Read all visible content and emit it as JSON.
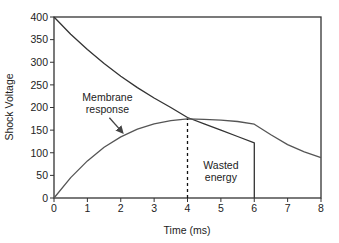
{
  "chart_data": {
    "type": "line",
    "title": "",
    "xlabel": "Time (ms)",
    "ylabel": "Shock Voltage",
    "xlim": [
      0,
      8
    ],
    "ylim": [
      0,
      400
    ],
    "x_ticks": [
      0,
      1,
      2,
      3,
      4,
      5,
      6,
      7,
      8
    ],
    "y_ticks": [
      0,
      50,
      100,
      150,
      200,
      250,
      300,
      350,
      400
    ],
    "grid": false,
    "legend": null,
    "series": [
      {
        "name": "Shock voltage (truncated exponential)",
        "color": "#333333",
        "x": [
          0,
          0.5,
          1,
          1.5,
          2,
          2.5,
          3,
          3.5,
          4,
          4.5,
          5,
          5.5,
          6,
          6
        ],
        "y": [
          400,
          362,
          328,
          297,
          269,
          244,
          221,
          200,
          178,
          164,
          150,
          136,
          122,
          0
        ]
      },
      {
        "name": "Membrane response",
        "color": "#555555",
        "x": [
          0,
          0.5,
          1,
          1.5,
          2,
          2.5,
          3,
          3.5,
          4,
          4.5,
          5,
          5.5,
          6,
          6.5,
          7,
          7.5,
          8
        ],
        "y": [
          0,
          45,
          82,
          112,
          135,
          152,
          164,
          171,
          175,
          174,
          172,
          169,
          163,
          140,
          118,
          102,
          89
        ]
      }
    ],
    "annotations": [
      {
        "text": "Membrane response",
        "x": 1.6,
        "y": 215,
        "arrow_to": [
          2.05,
          145
        ]
      },
      {
        "text": "Wasted energy",
        "x": 5.0,
        "y": 65
      },
      {
        "type": "dashed-vline",
        "x": 4,
        "y_from": 0,
        "y_to": 175
      }
    ]
  }
}
